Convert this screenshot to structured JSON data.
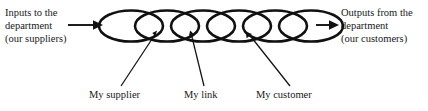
{
  "diagram": {
    "stroke_color": "#111111",
    "background_color": "#ffffff",
    "text_color": "#171717",
    "left_annotation": {
      "name": "inputs-to-the-department",
      "line1": "Inputs to the",
      "line2": "department",
      "line3": "(our suppliers)"
    },
    "right_annotation": {
      "name": "outputs-from-the-department",
      "line1": "Outputs from the",
      "line2": "department",
      "line3": "(our customers)"
    },
    "callouts": [
      {
        "id": "my-supplier",
        "label": "My supplier"
      },
      {
        "id": "my-link",
        "label": "My link"
      },
      {
        "id": "my-customer",
        "label": "My customer"
      }
    ],
    "chain": {
      "link_count": 6,
      "shape": "ellipse"
    },
    "arrows": {
      "input_arrow": "arrow-right",
      "output_arrow": "arrow-right"
    }
  }
}
